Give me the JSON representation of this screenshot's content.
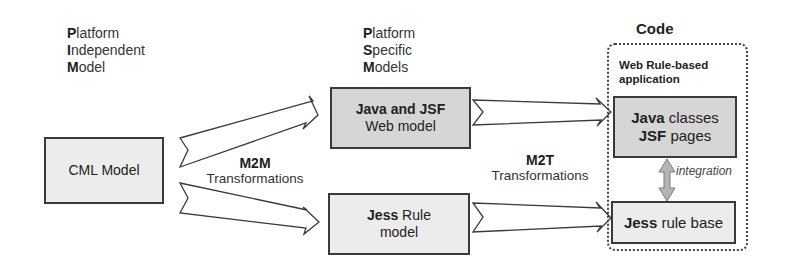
{
  "columns": {
    "pim": {
      "lines": [
        {
          "first": "P",
          "rest": "latform"
        },
        {
          "first": "I",
          "rest": "ndependent"
        },
        {
          "first": "M",
          "rest": "odel"
        }
      ]
    },
    "psm": {
      "lines": [
        {
          "first": "P",
          "rest": "latform"
        },
        {
          "first": "S",
          "rest": "pecific"
        },
        {
          "first": "M",
          "rest": "odels"
        }
      ]
    },
    "code": {
      "title": "Code"
    }
  },
  "boxes": {
    "cml": {
      "label": "CML Model"
    },
    "java_jsf": {
      "bold": "Java and JSF",
      "normal": "Web model"
    },
    "jess_model": {
      "bold": "Jess",
      "normal1": " Rule",
      "normal2": "model"
    },
    "java_classes": {
      "bold1": "Java",
      "normal1": " classes",
      "bold2": "JSF",
      "normal2": " pages"
    },
    "jess_base": {
      "bold": "Jess",
      "normal": " rule base"
    }
  },
  "container": {
    "label_line1": "Web Rule-based",
    "label_line2": "application"
  },
  "transformations": {
    "m2m": {
      "title": "M2M",
      "subtitle": "Transformations"
    },
    "m2t": {
      "title": "M2T",
      "subtitle": "Transformations"
    }
  },
  "integration": {
    "label": "integration"
  },
  "colors": {
    "box_light": "#ececec",
    "box_dark": "#d6d6d6",
    "border": "#3a3a3a",
    "integration_arrow": "#b5b5b5"
  }
}
